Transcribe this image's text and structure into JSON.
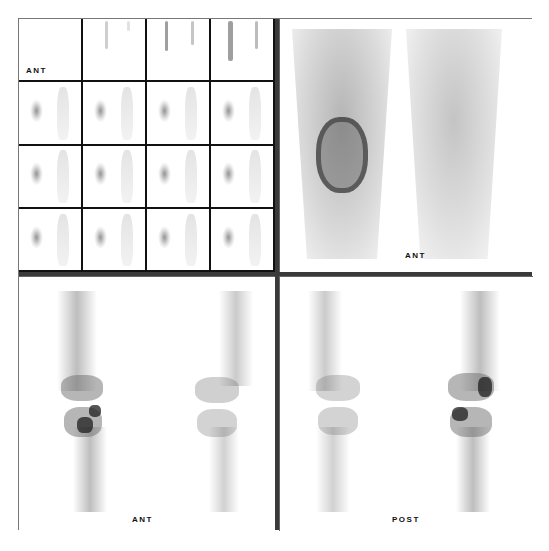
{
  "figure": {
    "panels": {
      "dynamic_flow_grid": {
        "rows": 4,
        "columns": 4,
        "frames": 16,
        "label": "ANT"
      },
      "blood_pool": {
        "label": "ANT"
      },
      "delayed_anterior": {
        "label": "ANT"
      },
      "delayed_posterior": {
        "label": "POST"
      }
    },
    "colors": {
      "background": "#ffffff",
      "frame_border": "#777777",
      "divider": "#3a3a3a",
      "grid_lines": "#111111",
      "uptake": "#333333"
    }
  }
}
